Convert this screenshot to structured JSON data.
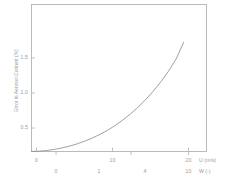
{
  "chart_data": {
    "type": "line",
    "title": "",
    "ylabel": "Error in Aerosol Content (%)",
    "xlabel_primary": "U (m/s)",
    "xlabel_secondary": "W (-)",
    "xticks_primary": [
      "0",
      "10",
      "20"
    ],
    "xticks_primary_values": [
      0,
      10,
      20
    ],
    "xticks_secondary": [
      "0",
      "1",
      "4",
      "10"
    ],
    "xticks_secondary_values": [
      0,
      1,
      4,
      10
    ],
    "yticks": [
      "0.5",
      "1.0",
      "1.5"
    ],
    "yticks_values": [
      0.5,
      1.0,
      1.5
    ],
    "xlim": [
      0,
      23
    ],
    "ylim": [
      0,
      1.75
    ],
    "grid": false,
    "legend": "none",
    "line_color": "#8f8f8f",
    "frame_color": "#b0b0b0",
    "series": [
      {
        "name": "Error in Aerosol Content",
        "x": [
          0,
          1,
          2,
          3,
          4,
          5,
          6,
          7,
          8,
          9,
          10,
          11,
          12,
          13,
          14,
          15,
          16,
          17,
          18,
          19,
          20
        ],
        "y": [
          0.0,
          0.004,
          0.012,
          0.025,
          0.042,
          0.064,
          0.091,
          0.123,
          0.161,
          0.204,
          0.253,
          0.31,
          0.375,
          0.447,
          0.527,
          0.617,
          0.718,
          0.83,
          0.955,
          1.1,
          1.3
        ]
      }
    ]
  },
  "axes": {
    "y_tick_0": "0.5",
    "y_tick_1": "1.0",
    "y_tick_2": "1.5",
    "x_primary_tick_0": "0",
    "x_primary_tick_1": "10",
    "x_primary_tick_2": "20",
    "x_secondary_tick_0": "0",
    "x_secondary_tick_1": "1",
    "x_secondary_tick_2": "4",
    "x_secondary_tick_3": "10",
    "x_title_primary": "U (m/s)",
    "x_title_secondary": "W (-)",
    "y_title": "Error in Aerosol Content (%)"
  }
}
